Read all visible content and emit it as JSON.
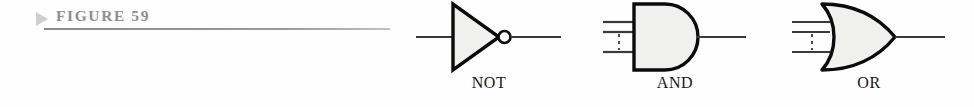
{
  "figure": {
    "marker_icon": "triangle-right-icon",
    "label": "FIGURE 59",
    "label_color": "#8e8e92",
    "rule_color": "#8f8f93"
  },
  "diagram": {
    "fill_color": "#f0f0ee",
    "stroke_color": "#000000",
    "wire_color": "#3a3a3e",
    "gates": [
      {
        "id": "not",
        "label": "NOT",
        "shape": "triangle-with-bubble",
        "inputs": 1,
        "outputs": 1,
        "has_inversion_bubble": true,
        "ellipsis_dashes": false
      },
      {
        "id": "and",
        "label": "AND",
        "shape": "d-shape",
        "inputs": 3,
        "outputs": 1,
        "has_inversion_bubble": false,
        "ellipsis_dashes": true
      },
      {
        "id": "or",
        "label": "OR",
        "shape": "curved-back-pointed",
        "inputs": 3,
        "outputs": 1,
        "has_inversion_bubble": false,
        "ellipsis_dashes": true
      }
    ]
  }
}
